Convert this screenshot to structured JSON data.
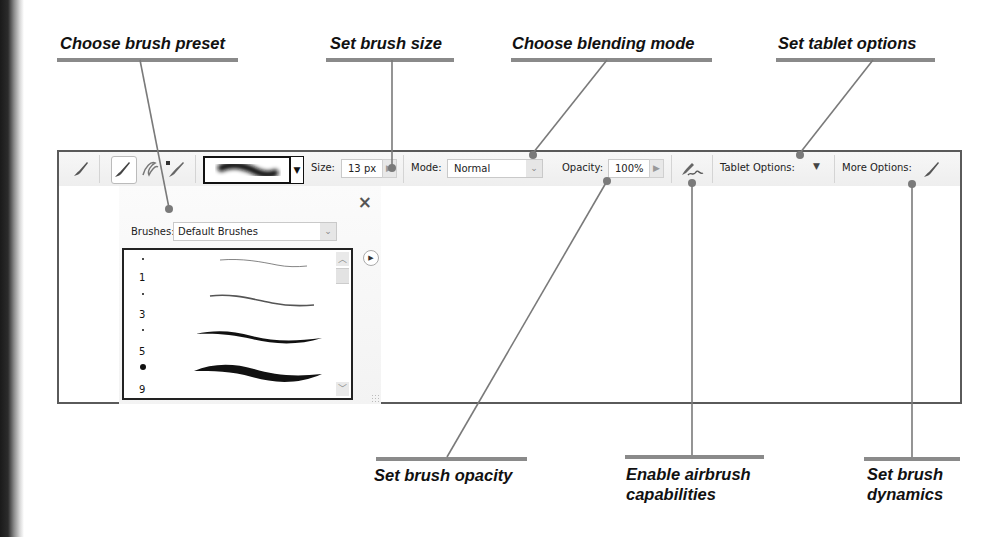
{
  "callouts": {
    "top": [
      {
        "id": "brush_preset",
        "label": "Choose brush preset"
      },
      {
        "id": "brush_size",
        "label": "Set brush size"
      },
      {
        "id": "blending_mode",
        "label": "Choose blending mode"
      },
      {
        "id": "tablet_options",
        "label": "Set tablet options"
      }
    ],
    "bottom": [
      {
        "id": "opacity",
        "label": "Set brush opacity"
      },
      {
        "id": "airbrush",
        "label_line1": "Enable airbrush",
        "label_line2": "capabilities"
      },
      {
        "id": "dynamics",
        "label_line1": "Set brush",
        "label_line2": "dynamics"
      }
    ]
  },
  "toolbar": {
    "tool_icons": [
      "brush-tool-icon",
      "brush-icon",
      "impressionist-brush-icon",
      "color-replacement-icon"
    ],
    "size_label": "Size:",
    "size_value": "13 px",
    "mode_label": "Mode:",
    "mode_value": "Normal",
    "opacity_label": "Opacity:",
    "opacity_value": "100%",
    "tablet_options_label": "Tablet Options:",
    "more_options_label": "More Options:"
  },
  "brush_picker": {
    "close_glyph": "×",
    "brushes_label": "Brushes:",
    "brushes_value": "Default Brushes",
    "presets": [
      {
        "size": "1"
      },
      {
        "size": "3"
      },
      {
        "size": "5"
      },
      {
        "size": "9"
      }
    ]
  },
  "colors": {
    "callout_line": "#8a8a8a",
    "frame_border": "#5a5a5a",
    "dot": "#7a7a7a"
  }
}
